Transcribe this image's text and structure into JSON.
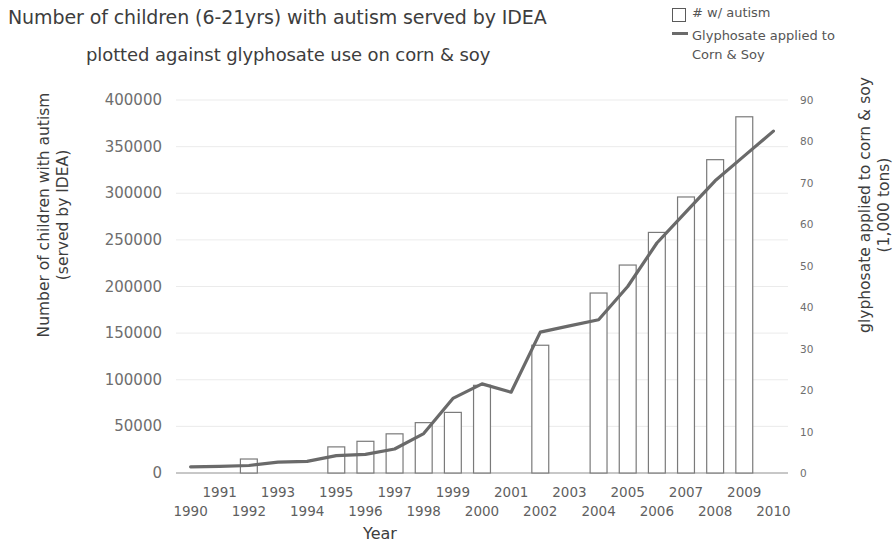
{
  "title": {
    "line1": "Number of children (6-21yrs) with autism served by IDEA",
    "line2": "plotted against glyphosate use on corn & soy"
  },
  "legend": {
    "position": "top-right",
    "items": [
      {
        "marker": "open-square",
        "label": "# w/ autism"
      },
      {
        "marker": "line",
        "label": "Glyphosate applied to",
        "label2": "Corn & Soy"
      }
    ]
  },
  "axes": {
    "x_title": "Year",
    "y_left_title_line1": "Number of children with autism",
    "y_left_title_line2": "(served by IDEA)",
    "y_right_title_line1": "glyphosate applied to corn & soy",
    "y_right_title_line2": "(1,000 tons)",
    "y_left_ticks": [
      "0",
      "50000",
      "100000",
      "150000",
      "200000",
      "250000",
      "300000",
      "350000",
      "400000"
    ],
    "y_right_ticks": [
      "0",
      "10",
      "20",
      "30",
      "40",
      "50",
      "60",
      "70",
      "80",
      "90"
    ],
    "x_ticks_top_row": [
      "1991",
      "1993",
      "1995",
      "1997",
      "1999",
      "2001",
      "2003",
      "2005",
      "2007",
      "2009"
    ],
    "x_ticks_bottom_row": [
      "1990",
      "1992",
      "1994",
      "1996",
      "1998",
      "2000",
      "2002",
      "2004",
      "2006",
      "2008",
      "2010"
    ]
  },
  "colors": {
    "line": "#6a6a6a",
    "bar_stroke": "#7a7a7a",
    "bar_fill": "#ffffff",
    "text": "#4a4a4a",
    "grid": "#e6e6e6"
  },
  "chart_data": {
    "type": "bar",
    "title": "Number of children (6-21yrs) with autism served by IDEA plotted against glyphosate use on corn & soy",
    "xlabel": "Year",
    "ylabel": "Number of children with autism (served by IDEA)",
    "y2label": "glyphosate applied to corn & soy (1,000 tons)",
    "grid": false,
    "legend_position": "top-right",
    "x": [
      1990,
      1991,
      1992,
      1993,
      1994,
      1995,
      1996,
      1997,
      1998,
      1999,
      2000,
      2001,
      2002,
      2003,
      2004,
      2005,
      2006,
      2007,
      2008,
      2009,
      2010
    ],
    "xlim": [
      1989.5,
      2010.5
    ],
    "ylim": [
      0,
      400000
    ],
    "y2lim": [
      0,
      90
    ],
    "series": [
      {
        "name": "# w/ autism",
        "type": "bar",
        "axis": "left",
        "values": [
          null,
          null,
          15000,
          null,
          null,
          28000,
          34000,
          42000,
          54000,
          65000,
          94000,
          null,
          137000,
          null,
          193000,
          223000,
          258000,
          296000,
          336000,
          382000,
          null
        ]
      },
      {
        "name": "Glyphosate applied to Corn & Soy",
        "type": "line",
        "axis": "right",
        "values": [
          1.5,
          1.6,
          1.8,
          2.6,
          2.8,
          4.2,
          4.5,
          5.8,
          9.5,
          18.0,
          21.5,
          19.5,
          34.0,
          35.5,
          37.0,
          45.0,
          55.5,
          63.0,
          70.5,
          76.5,
          82.5
        ]
      }
    ]
  }
}
